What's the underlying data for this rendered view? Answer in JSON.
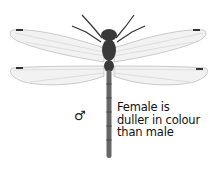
{
  "illustration": {
    "subject": "dragonfly (dorsal view)",
    "sex_symbol": "♂",
    "caption_lines": [
      "Female is",
      "duller in colour",
      "than male"
    ]
  }
}
